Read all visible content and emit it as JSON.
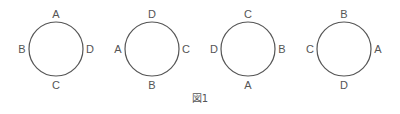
{
  "figure": {
    "caption": "図1",
    "stroke_color": "#555555",
    "label_color": "#555555",
    "circles": [
      {
        "cx": 56,
        "cy": 49,
        "r": 27,
        "top": "A",
        "left": "B",
        "right": "D",
        "bottom": "C"
      },
      {
        "cx": 152,
        "cy": 49,
        "r": 27,
        "top": "D",
        "left": "A",
        "right": "C",
        "bottom": "B"
      },
      {
        "cx": 248,
        "cy": 49,
        "r": 27,
        "top": "C",
        "left": "D",
        "right": "B",
        "bottom": "A"
      },
      {
        "cx": 344,
        "cy": 49,
        "r": 27,
        "top": "B",
        "left": "C",
        "right": "A",
        "bottom": "D"
      }
    ]
  }
}
